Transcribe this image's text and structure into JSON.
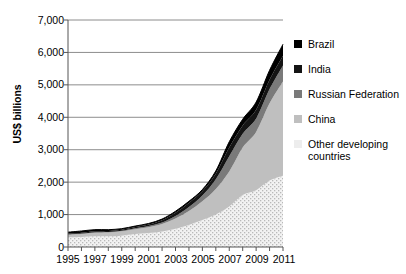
{
  "chart_data": {
    "type": "area",
    "title": "",
    "subtitle": "",
    "xlabel": "",
    "ylabel": "US$ billions",
    "xlim": [
      1995,
      2011
    ],
    "ylim": [
      0,
      7000
    ],
    "grid": true,
    "stacked": true,
    "legend_position": "right",
    "x": [
      1995,
      1996,
      1997,
      1998,
      1999,
      2000,
      2001,
      2002,
      2003,
      2004,
      2005,
      2006,
      2007,
      2008,
      2009,
      2010,
      2011
    ],
    "xticklabels": [
      "1995",
      "1997",
      "1999",
      "2001",
      "2003",
      "2005",
      "2007",
      "2009",
      "2011"
    ],
    "yticklabels": [
      "0",
      "1,000",
      "2,000",
      "3,000",
      "4,000",
      "5,000",
      "6,000",
      "7,000"
    ],
    "ytickvalues": [
      0,
      1000,
      2000,
      3000,
      4000,
      5000,
      6000,
      7000
    ],
    "series": [
      {
        "name": "Other developing countries",
        "color": "#ededed",
        "pattern": "dotted",
        "values": [
          300,
          310,
          330,
          330,
          350,
          400,
          430,
          480,
          560,
          680,
          830,
          1000,
          1250,
          1600,
          1750,
          2050,
          2200
        ]
      },
      {
        "name": "China",
        "color": "#bfbfbf",
        "pattern": "solid",
        "values": [
          75,
          90,
          110,
          120,
          135,
          150,
          180,
          230,
          320,
          430,
          580,
          790,
          1080,
          1470,
          1800,
          2380,
          2900
        ]
      },
      {
        "name": "Russian Federation",
        "color": "#7a7a7a",
        "pattern": "solid",
        "values": [
          15,
          16,
          18,
          12,
          13,
          25,
          34,
          45,
          75,
          120,
          175,
          300,
          470,
          425,
          415,
          440,
          500
        ]
      },
      {
        "name": "India",
        "color": "#141414",
        "pattern": "solid",
        "values": [
          18,
          20,
          25,
          28,
          32,
          38,
          46,
          68,
          98,
          126,
          132,
          170,
          265,
          250,
          265,
          290,
          300
        ]
      },
      {
        "name": "Brazil",
        "color": "#000000",
        "pattern": "solid",
        "values": [
          50,
          58,
          52,
          44,
          36,
          33,
          36,
          38,
          49,
          53,
          54,
          86,
          180,
          194,
          239,
          289,
          352
        ]
      }
    ],
    "totals": [
      458,
      494,
      535,
      534,
      566,
      646,
      726,
      861,
      1102,
      1409,
      1771,
      2346,
      3245,
      3939,
      4469,
      5449,
      6252
    ]
  },
  "legend": {
    "items": [
      {
        "label": "Brazil",
        "color": "#000000"
      },
      {
        "label": "India",
        "color": "#141414"
      },
      {
        "label": "Russian Federation",
        "color": "#7a7a7a"
      },
      {
        "label": "China",
        "color": "#bfbfbf"
      },
      {
        "label": "Other developing\ncountries",
        "color": "#ededed"
      }
    ]
  }
}
